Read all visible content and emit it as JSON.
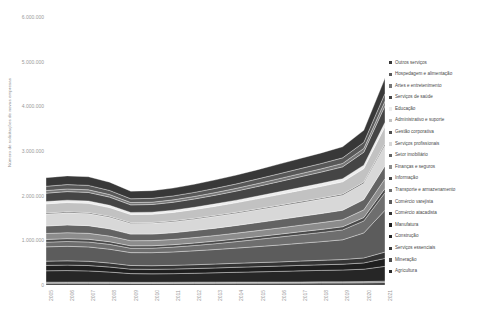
{
  "chart_data": {
    "type": "area",
    "title": "",
    "xlabel": "",
    "ylabel": "Número de solicitações de novas empresas",
    "ylim": [
      0,
      6000000
    ],
    "yticks": [
      0,
      1000000,
      2000000,
      3000000,
      4000000,
      5000000,
      6000000
    ],
    "ytick_labels": [
      "0",
      "1.000.000",
      "2.000.000",
      "3.000.000",
      "4.000.000",
      "5.000.000",
      "6.000.000"
    ],
    "grid": false,
    "legend_position": "right",
    "stacked": true,
    "categories": [
      2005,
      2006,
      2007,
      2008,
      2009,
      2010,
      2011,
      2012,
      2013,
      2014,
      2015,
      2016,
      2017,
      2018,
      2019,
      2020,
      2021
    ],
    "xtick_labels": [
      "2005",
      "2006",
      "2007",
      "2008",
      "2009",
      "2010",
      "2011",
      "2012",
      "2013",
      "2014",
      "2015",
      "2016",
      "2017",
      "2018",
      "2019",
      "2020",
      "2021"
    ],
    "series": [
      {
        "name": "Agricultura",
        "color": "#2b2b2b",
        "values": [
          38000,
          38000,
          37000,
          36000,
          34000,
          34000,
          35000,
          36000,
          37000,
          38000,
          39000,
          40000,
          41000,
          42000,
          43000,
          46000,
          52000
        ]
      },
      {
        "name": "Mineração",
        "color": "#4d4d4d",
        "values": [
          14000,
          15000,
          16000,
          16000,
          14000,
          14000,
          15000,
          16000,
          16000,
          16000,
          15000,
          14000,
          14000,
          15000,
          15000,
          15000,
          17000
        ]
      },
      {
        "name": "Serviços essenciais",
        "color": "#3a3a3a",
        "values": [
          12000,
          12000,
          13000,
          13000,
          12000,
          12000,
          12000,
          13000,
          13000,
          13000,
          13000,
          13000,
          14000,
          14000,
          14000,
          15000,
          18000
        ]
      },
      {
        "name": "Construção",
        "color": "#262626",
        "values": [
          255000,
          258000,
          250000,
          225000,
          195000,
          190000,
          192000,
          198000,
          208000,
          218000,
          228000,
          238000,
          248000,
          256000,
          264000,
          278000,
          330000
        ]
      },
      {
        "name": "Manufatura",
        "color": "#1f1f1f",
        "values": [
          120000,
          122000,
          120000,
          112000,
          100000,
          100000,
          102000,
          105000,
          108000,
          112000,
          115000,
          118000,
          122000,
          126000,
          130000,
          140000,
          178000
        ]
      },
      {
        "name": "Comércio atacadista",
        "color": "#343434",
        "values": [
          95000,
          96000,
          95000,
          90000,
          82000,
          82000,
          84000,
          86000,
          88000,
          90000,
          92000,
          94000,
          97000,
          100000,
          104000,
          112000,
          142000
        ]
      },
      {
        "name": "Comércio varejista",
        "color": "#5c5c5c",
        "values": [
          320000,
          325000,
          322000,
          310000,
          288000,
          292000,
          300000,
          312000,
          325000,
          340000,
          358000,
          378000,
          398000,
          418000,
          442000,
          560000,
          938000
        ]
      },
      {
        "name": "Transporte e armazenamento",
        "color": "#6e6e6e",
        "values": [
          105000,
          108000,
          110000,
          108000,
          98000,
          100000,
          108000,
          118000,
          130000,
          145000,
          162000,
          178000,
          192000,
          206000,
          222000,
          268000,
          392000
        ]
      },
      {
        "name": "Informação",
        "color": "#494949",
        "values": [
          62000,
          63000,
          62000,
          59000,
          54000,
          54000,
          55000,
          56000,
          58000,
          60000,
          62000,
          64000,
          66000,
          68000,
          70000,
          76000,
          96000
        ]
      },
      {
        "name": "Finanças e seguros",
        "color": "#8c8c8c",
        "values": [
          132000,
          134000,
          132000,
          126000,
          116000,
          116000,
          118000,
          122000,
          126000,
          130000,
          135000,
          140000,
          146000,
          152000,
          158000,
          172000,
          218000
        ]
      },
      {
        "name": "Setor imobiliário",
        "color": "#636363",
        "values": [
          168000,
          172000,
          172000,
          162000,
          146000,
          146000,
          150000,
          156000,
          164000,
          172000,
          180000,
          188000,
          196000,
          204000,
          212000,
          230000,
          288000
        ]
      },
      {
        "name": "Serviços profissionais",
        "color": "#d8d8d8",
        "values": [
          268000,
          272000,
          270000,
          258000,
          238000,
          240000,
          246000,
          254000,
          264000,
          274000,
          286000,
          298000,
          310000,
          322000,
          336000,
          366000,
          462000
        ]
      },
      {
        "name": "Gestão corporativa",
        "color": "#4f4f4f",
        "values": [
          22000,
          23000,
          23000,
          22000,
          20000,
          20000,
          20000,
          21000,
          22000,
          22000,
          23000,
          24000,
          24000,
          25000,
          26000,
          28000,
          35000
        ]
      },
      {
        "name": "Administrativo e suporte",
        "color": "#c2c2c2",
        "values": [
          205000,
          208000,
          206000,
          196000,
          180000,
          182000,
          188000,
          196000,
          205000,
          215000,
          226000,
          238000,
          250000,
          262000,
          274000,
          300000,
          380000
        ]
      },
      {
        "name": "Educação",
        "color": "#ededed",
        "values": [
          52000,
          53000,
          53000,
          51000,
          47000,
          48000,
          49000,
          51000,
          53000,
          55000,
          58000,
          61000,
          64000,
          67000,
          70000,
          77000,
          98000
        ]
      },
      {
        "name": "Serviços de saúde",
        "color": "#454545",
        "values": [
          188000,
          192000,
          192000,
          184000,
          170000,
          172000,
          178000,
          186000,
          195000,
          205000,
          216000,
          228000,
          240000,
          252000,
          265000,
          290000,
          368000
        ]
      },
      {
        "name": "Artes e entretenimento",
        "color": "#767676",
        "values": [
          58000,
          59000,
          59000,
          56000,
          52000,
          52000,
          54000,
          56000,
          58000,
          61000,
          64000,
          67000,
          70000,
          73000,
          77000,
          84000,
          106000
        ]
      },
      {
        "name": "Hospedagem e alimentação",
        "color": "#585858",
        "values": [
          96000,
          98000,
          98000,
          93000,
          85000,
          86000,
          88000,
          91000,
          95000,
          99000,
          104000,
          109000,
          114000,
          119000,
          125000,
          136000,
          172000
        ]
      },
      {
        "name": "Outros serviços",
        "color": "#383838",
        "values": [
          192000,
          195000,
          194000,
          185000,
          170000,
          172000,
          176000,
          183000,
          190000,
          198000,
          207000,
          217000,
          227000,
          237000,
          248000,
          270000,
          342000
        ]
      }
    ],
    "legend_order": [
      "Outros serviços",
      "Hospedagem e alimentação",
      "Artes e entretenimento",
      "Serviços de saúde",
      "Educação",
      "Administrativo e suporte",
      "Gestão corporativa",
      "Serviços profissionais",
      "Setor imobiliário",
      "Finanças e seguros",
      "Informação",
      "Transporte e armazenamento",
      "Comércio varejista",
      "Comércio atacadista",
      "Manufatura",
      "Construção",
      "Serviços essenciais",
      "Mineração",
      "Agricultura"
    ]
  }
}
